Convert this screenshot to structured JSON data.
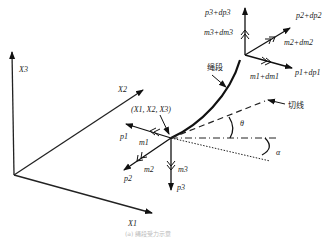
{
  "axes": {
    "x1": "X1",
    "x2": "X2",
    "x3": "X3"
  },
  "node_point": "(X1, X2, X3)",
  "rope_segment_label": "绳段",
  "tangent_label": "切线",
  "angles": {
    "theta": "θ",
    "alpha": "α"
  },
  "lower_node": {
    "forces": [
      "p1",
      "p2",
      "p3"
    ],
    "moments": [
      "m1",
      "m2",
      "m3"
    ]
  },
  "upper_node": {
    "forces": [
      "p1+dp1",
      "p2+dp2",
      "p3+dp3"
    ],
    "moments": [
      "m1+dm1",
      "m2+dm2",
      "m3+dm3"
    ]
  },
  "caption": "(a) 绳段受力示意"
}
